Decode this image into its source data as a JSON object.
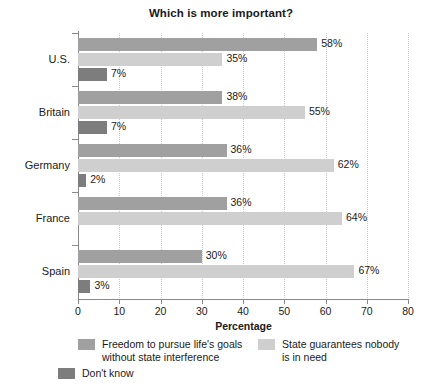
{
  "chart_data": {
    "type": "bar",
    "orientation": "horizontal",
    "title": "Which is more important?",
    "xlabel": "Percentage",
    "ylabel": "",
    "xlim": [
      0,
      80
    ],
    "xticks": [
      0,
      10,
      20,
      30,
      40,
      50,
      60,
      70,
      80
    ],
    "grid": true,
    "grid_axis": "x",
    "legend_position": "bottom",
    "categories": [
      "U.S.",
      "Britain",
      "Germany",
      "France",
      "Spain"
    ],
    "series": [
      {
        "name": "Freedom to pursue life's goals without state interference",
        "color": "#a0a0a0",
        "values": [
          58,
          35,
          36,
          36,
          30
        ],
        "labels": [
          "58%",
          "38%",
          "36%",
          "36%",
          "30%"
        ]
      },
      {
        "name": "State guarantees nobody is in need",
        "color": "#cfcfcf",
        "values": [
          35,
          55,
          62,
          64,
          67
        ],
        "labels": [
          "35%",
          "55%",
          "62%",
          "64%",
          "67%"
        ]
      },
      {
        "name": "Don't know",
        "color": "#7d7d7d",
        "values": [
          7,
          7,
          2,
          0,
          3
        ],
        "labels": [
          "7%",
          "7%",
          "2%",
          "",
          "3%"
        ]
      }
    ],
    "data_by_category": [
      {
        "category": "U.S.",
        "freedom": 58,
        "state": 35,
        "dont_know": 7
      },
      {
        "category": "Britain",
        "freedom": 38,
        "state": 55,
        "dont_know": 7
      },
      {
        "category": "Germany",
        "freedom": 36,
        "state": 62,
        "dont_know": 2
      },
      {
        "category": "France",
        "freedom": 36,
        "state": 64,
        "dont_know": 0
      },
      {
        "category": "Spain",
        "freedom": 30,
        "state": 67,
        "dont_know": 3
      }
    ]
  },
  "legend": {
    "items": [
      {
        "label": "Freedom to pursue life's goals\nwithout state interference",
        "color": "#a0a0a0"
      },
      {
        "label": "State guarantees nobody\nis in need",
        "color": "#cfcfcf"
      },
      {
        "label": "Don't know",
        "color": "#7d7d7d"
      }
    ]
  },
  "axis": {
    "x_title": "Percentage",
    "tick_labels": [
      "0",
      "10",
      "20",
      "30",
      "40",
      "50",
      "60",
      "70",
      "80"
    ]
  },
  "colors": {
    "series_freedom": "#a0a0a0",
    "series_state": "#cfcfcf",
    "series_dont_know": "#7d7d7d",
    "axis": "#8a8a8a",
    "grid": "#c9c9c9",
    "text": "#1a1a1a",
    "background": "#ffffff"
  }
}
